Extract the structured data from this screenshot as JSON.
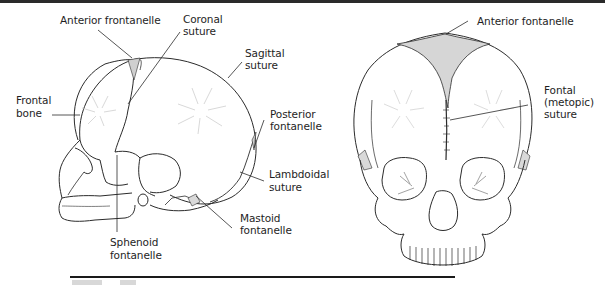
{
  "figure": {
    "views": [
      {
        "name": "lateral-view",
        "labels": {
          "anterior_fontanelle": "Anterior frontanelle",
          "coronal_suture_1": "Coronal",
          "coronal_suture_2": "suture",
          "sagittal_suture_1": "Sagittal",
          "sagittal_suture_2": "suture",
          "frontal_bone_1": "Frontal",
          "frontal_bone_2": "bone",
          "posterior_fontanelle_1": "Posterior",
          "posterior_fontanelle_2": "fontanelle",
          "lambdoidal_suture_1": "Lambdoidal",
          "lambdoidal_suture_2": "suture",
          "mastoid_fontanelle_1": "Mastoid",
          "mastoid_fontanelle_2": "fontanelle",
          "sphenoid_fontanelle_1": "Sphenoid",
          "sphenoid_fontanelle_2": "fontanelle"
        }
      },
      {
        "name": "anterior-view",
        "labels": {
          "anterior_fontanelle": "Anterior fontanelle",
          "frontal_suture_1": "Fontal",
          "frontal_suture_2": "(metopic)",
          "frontal_suture_3": "suture"
        }
      }
    ],
    "colors": {
      "line": "#2b2b2b",
      "fontanelle_fill": "#d9d9d9",
      "rule": "#1a1a1a"
    }
  }
}
